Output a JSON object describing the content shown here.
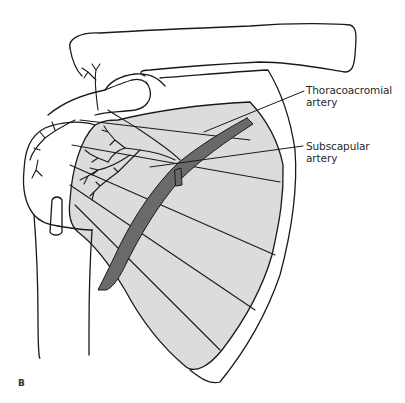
{
  "figure": {
    "panel_letter": "B",
    "colors": {
      "background": "#ffffff",
      "outline": "#1a1a1a",
      "muscle_fill": "#dcdcdc",
      "artery_fill": "#6a6a6a"
    },
    "labels": [
      {
        "id": "thoracoacromial",
        "line1": "Thoracoacromial",
        "line2": "artery"
      },
      {
        "id": "subscapular",
        "line1": "Subscapular",
        "line2": "artery"
      }
    ]
  }
}
